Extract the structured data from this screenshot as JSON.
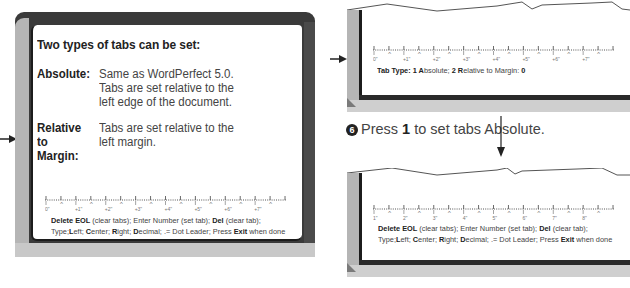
{
  "left_screen": {
    "heading": "Two types of tabs can be set:",
    "definitions": [
      {
        "term": "Absolute:",
        "description": "Same as WordPerfect 5.0. Tabs are set relative to the left edge of the document."
      },
      {
        "term": "Relative to Margin:",
        "description": "Tabs are set relative to the left margin."
      }
    ],
    "ruler_labels": [
      "0\"",
      "+1\"",
      "+2\"",
      "+3\"",
      "+4\"",
      "+5\"",
      "+6\"",
      "+7\""
    ],
    "help_line1": {
      "b1": "Delete EOL",
      "t1": " (clear tabs); Enter Number (set tab); ",
      "b2": "Del",
      "t2": " (clear tab);"
    },
    "help_line2": {
      "t0": "Type;",
      "b1": "L",
      "t1": "eft; ",
      "b2": "C",
      "t2": "enter; ",
      "b3": "R",
      "t3": "ight; ",
      "b4": "D",
      "t4": "ecimal; .= Dot Leader; Press ",
      "b5": "Exit",
      "t5": " when done"
    }
  },
  "right_top_screen": {
    "ruler_labels": [
      "0\"",
      "+1\"",
      "+2\"",
      "+3\"",
      "+4\"",
      "+5\"",
      "+6\"",
      "+7\""
    ],
    "prompt": {
      "b1": "Tab Type: 1 A",
      "t1": "bsolute; ",
      "b2": "2 R",
      "t2": "elative to Margin: ",
      "b3": "0"
    }
  },
  "step": {
    "number": "6",
    "text_before": "Press ",
    "key": "1",
    "text_after": " to set tabs Absolute."
  },
  "right_bottom_screen": {
    "ruler_labels": [
      "1\"",
      "2\"",
      "3\"",
      "4\"",
      "5\"",
      "6\"",
      "7\"",
      "8\""
    ],
    "help_line1": {
      "b1": "Delete EOL",
      "t1": " (clear tabs); Enter Number (set tab); ",
      "b2": "Del",
      "t2": " (clear tab);"
    },
    "help_line2": {
      "t0": "Type;",
      "b1": "L",
      "t1": "eft; ",
      "b2": "C",
      "t2": "enter; ",
      "b3": "R",
      "t3": "ight; ",
      "b4": "D",
      "t4": "ecimal; .= Dot Leader; Press ",
      "b5": "Exit",
      "t5": " when done"
    }
  },
  "colors": {
    "frame_dark": "#3a3a3a",
    "bevel_light": "#b5b5b5",
    "screen_bg": "#ffffff",
    "text": "#2a2a2a"
  }
}
